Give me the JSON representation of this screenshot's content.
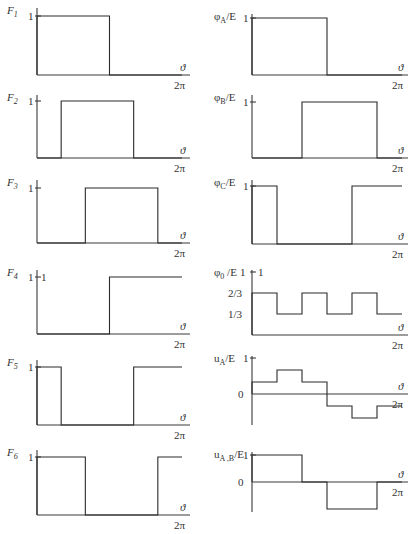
{
  "axis_labels": {
    "x_var": "ϑ",
    "x_end": "2π"
  },
  "panels": [
    {
      "id": "F1",
      "name": "F",
      "sub": "1",
      "ticks": [
        "1"
      ]
    },
    {
      "id": "F2",
      "name": "F",
      "sub": "2",
      "ticks": [
        "1"
      ]
    },
    {
      "id": "F3",
      "name": "F",
      "sub": "3",
      "ticks": [
        "1"
      ]
    },
    {
      "id": "F4",
      "name": "F",
      "sub": "4",
      "ticks": [
        "1",
        "1"
      ]
    },
    {
      "id": "F5",
      "name": "F",
      "sub": "5",
      "ticks": [
        "1"
      ]
    },
    {
      "id": "F6",
      "name": "F",
      "sub": "6",
      "ticks": [
        "1"
      ]
    },
    {
      "id": "phiA",
      "name": "φ",
      "sub": "A",
      "suffix": "/E",
      "ticks": [
        "1"
      ]
    },
    {
      "id": "phiB",
      "name": "φ",
      "sub": "B",
      "suffix": "/E",
      "ticks": [
        "1"
      ]
    },
    {
      "id": "phiC",
      "name": "φ",
      "sub": "C",
      "suffix": "/E",
      "ticks": [
        "1"
      ]
    },
    {
      "id": "phi0",
      "name": "φ",
      "sub": "0",
      "suffix": " /E",
      "ticks": [
        "1",
        "1",
        "2/3",
        "1/3"
      ]
    },
    {
      "id": "uA",
      "name": "u",
      "sub": "A",
      "suffix": "/E",
      "ticks": [
        "1",
        "0"
      ]
    },
    {
      "id": "uAB",
      "name": "u",
      "sub": "A ,B",
      "suffix": "/E",
      "ticks": [
        "1",
        "0"
      ]
    }
  ],
  "chart_data": [
    {
      "type": "line",
      "title": "F1",
      "xlabel": "ϑ",
      "x_range": [
        0,
        "2π"
      ],
      "step_breaks_sixths": [
        0,
        3
      ],
      "values_per_sixth": [
        1,
        1,
        1,
        0,
        0,
        0
      ]
    },
    {
      "type": "line",
      "title": "F2",
      "xlabel": "ϑ",
      "values_per_sixth": [
        0,
        1,
        1,
        1,
        0,
        0
      ]
    },
    {
      "type": "line",
      "title": "F3",
      "xlabel": "ϑ",
      "values_per_sixth": [
        0,
        0,
        1,
        1,
        1,
        0
      ]
    },
    {
      "type": "line",
      "title": "F4",
      "xlabel": "ϑ",
      "values_per_sixth": [
        0,
        0,
        0,
        1,
        1,
        1
      ]
    },
    {
      "type": "line",
      "title": "F5",
      "xlabel": "ϑ",
      "values_per_sixth": [
        1,
        0,
        0,
        0,
        1,
        1
      ]
    },
    {
      "type": "line",
      "title": "F6",
      "xlabel": "ϑ",
      "values_per_sixth": [
        1,
        1,
        0,
        0,
        0,
        1
      ]
    },
    {
      "type": "line",
      "title": "φA/E",
      "xlabel": "ϑ",
      "values_per_sixth": [
        1,
        1,
        1,
        0,
        0,
        0
      ]
    },
    {
      "type": "line",
      "title": "φB/E",
      "xlabel": "ϑ",
      "values_per_sixth": [
        0,
        0,
        1,
        1,
        1,
        0
      ]
    },
    {
      "type": "line",
      "title": "φC/E",
      "xlabel": "ϑ",
      "values_per_sixth": [
        1,
        0,
        0,
        0,
        1,
        1
      ]
    },
    {
      "type": "line",
      "title": "φ0/E",
      "xlabel": "ϑ",
      "yticks": [
        "1/3",
        "2/3",
        "1"
      ],
      "values_per_sixth": [
        0.6667,
        0.3333,
        0.6667,
        0.3333,
        0.6667,
        0.3333
      ]
    },
    {
      "type": "line",
      "title": "uA/E",
      "xlabel": "ϑ",
      "yticks": [
        "0",
        "1"
      ],
      "values_per_sixth": [
        0.3333,
        0.6667,
        0.3333,
        -0.3333,
        -0.6667,
        -0.3333
      ]
    },
    {
      "type": "line",
      "title": "uA,B/E",
      "xlabel": "ϑ",
      "yticks": [
        "0",
        "1"
      ],
      "values_per_sixth": [
        1,
        1,
        0,
        -1,
        -1,
        0
      ]
    }
  ]
}
